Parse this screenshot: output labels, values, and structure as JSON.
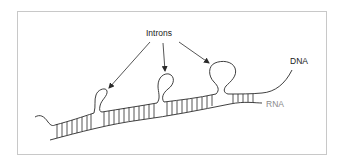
{
  "figure": {
    "labels": {
      "introns": "Introns",
      "dna": "DNA",
      "rna": "RNA"
    },
    "colors": {
      "line": "#2a2a2a",
      "rna_label": "#8a8a8a",
      "frame": "#c8c8c8"
    },
    "intron_loops": [
      {
        "name": "intron-loop-1",
        "size": "small"
      },
      {
        "name": "intron-loop-2",
        "size": "medium"
      },
      {
        "name": "intron-loop-3",
        "size": "large"
      }
    ]
  }
}
